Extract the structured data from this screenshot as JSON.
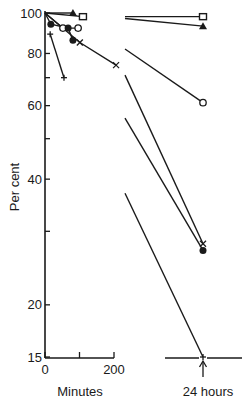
{
  "chart_data": {
    "type": "line",
    "title": "",
    "xlabel": "Minutes",
    "ylabel": "Per cent",
    "yscale": "log",
    "ylim": [
      15,
      100
    ],
    "xlim": [
      0,
      200
    ],
    "grid": false,
    "legend": "none",
    "y_ticks": [
      {
        "value": 100,
        "label": "100"
      },
      {
        "value": 80,
        "label": "80"
      },
      {
        "value": 70,
        "label": ""
      },
      {
        "value": 60,
        "label": "60"
      },
      {
        "value": 50,
        "label": ""
      },
      {
        "value": 40,
        "label": "40"
      },
      {
        "value": 30,
        "label": ""
      },
      {
        "value": 20,
        "label": "20"
      },
      {
        "value": 15,
        "label": "15"
      }
    ],
    "x_ticks": [
      {
        "value": 0,
        "label": "0"
      },
      {
        "value": 100,
        "label": ""
      },
      {
        "value": 200,
        "label": "200"
      }
    ],
    "break_annotation": "24 hours",
    "series": [
      {
        "name": "open-square",
        "marker": "square-open",
        "points": [
          {
            "x": 0,
            "y": 100
          },
          {
            "x": 110,
            "y": 98
          }
        ],
        "at_24h": 98,
        "line_from_y": 98
      },
      {
        "name": "filled-triangle",
        "marker": "triangle-filled",
        "points": [
          {
            "x": 0,
            "y": 100
          },
          {
            "x": 81,
            "y": 100
          }
        ],
        "at_24h": 93,
        "line_from_y": 97
      },
      {
        "name": "open-circle",
        "marker": "circle-open",
        "points": [
          {
            "x": 0,
            "y": 100
          },
          {
            "x": 52,
            "y": 92
          },
          {
            "x": 96,
            "y": 92
          }
        ],
        "at_24h": 61,
        "line_from_y": 82
      },
      {
        "name": "cross",
        "marker": "x",
        "points": [
          {
            "x": 0,
            "y": 100
          },
          {
            "x": 101,
            "y": 85
          },
          {
            "x": 206,
            "y": 75
          }
        ],
        "at_24h": 28,
        "line_from_y": 71
      },
      {
        "name": "filled-circle",
        "marker": "circle-filled",
        "points": [
          {
            "x": 0,
            "y": 100
          },
          {
            "x": 17,
            "y": 94
          },
          {
            "x": 67,
            "y": 92
          },
          {
            "x": 81,
            "y": 86
          }
        ],
        "at_24h": 27,
        "line_from_y": 56
      },
      {
        "name": "plus",
        "marker": "plus",
        "points": [
          {
            "x": 15,
            "y": 89
          },
          {
            "x": 55,
            "y": 70
          }
        ],
        "at_24h": 15,
        "line_from_y": 37
      }
    ]
  }
}
